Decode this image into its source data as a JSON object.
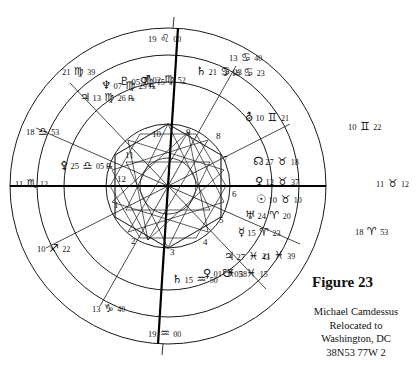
{
  "figure": {
    "title": "Figure 23",
    "subject": "Michael Camdessus",
    "line2": "Relocated to",
    "line3": "Washington, DC",
    "line4": "38N53 77W  2"
  },
  "chart": {
    "type": "astrological-natal-wheel",
    "center_x": 168,
    "center_y": 186,
    "radii": {
      "outer": 158,
      "zodiac_inner": 131,
      "planet_ring": 104,
      "house_circle": 62,
      "aspect_circle": 58
    }
  },
  "cusps": [
    {
      "id": "asc",
      "degree": "11",
      "sign": "♏",
      "minute": "12",
      "label": "Ascendant",
      "x": 16,
      "y": 176
    },
    {
      "id": "mc",
      "degree": "19",
      "sign": "♌",
      "minute": "00",
      "label": "Midheaven",
      "x": 150,
      "y": 29
    },
    {
      "id": "dsc",
      "degree": "11",
      "sign": "♉",
      "minute": "12",
      "label": "Descendant",
      "x": 377,
      "y": 176
    },
    {
      "id": "ic",
      "degree": "19",
      "sign": "♒",
      "minute": "00",
      "label": "Imum Coeli",
      "x": 150,
      "y": 327
    }
  ],
  "outer_signs": [
    {
      "degree": "19",
      "sign": "♌",
      "minute": "00",
      "x": 148,
      "y": 29
    },
    {
      "degree": "13",
      "sign": "♋",
      "minute": "40",
      "x": 229,
      "y": 48
    },
    {
      "degree": "21",
      "sign": "♍",
      "minute": "39",
      "x": 62,
      "y": 62
    },
    {
      "degree": "18",
      "sign": "♎",
      "minute": "53",
      "x": 26,
      "y": 122
    },
    {
      "degree": "11",
      "sign": "♏",
      "minute": "12",
      "x": 15,
      "y": 174
    },
    {
      "degree": "10",
      "sign": "♐",
      "minute": "22",
      "x": 37,
      "y": 239
    },
    {
      "degree": "13",
      "sign": "♑",
      "minute": "40",
      "x": 92,
      "y": 299
    },
    {
      "degree": "19",
      "sign": "♒",
      "minute": "00",
      "x": 148,
      "y": 324
    },
    {
      "degree": "21",
      "sign": "♓",
      "minute": "39",
      "x": 262,
      "y": 246
    },
    {
      "degree": "18",
      "sign": "♈",
      "minute": "53",
      "x": 355,
      "y": 222
    },
    {
      "degree": "11",
      "sign": "♉",
      "minute": "12",
      "x": 376,
      "y": 174
    },
    {
      "degree": "10",
      "sign": "♊",
      "minute": "22",
      "x": 348,
      "y": 117
    }
  ],
  "planets": [
    {
      "glyph": "♃",
      "name": "jupiter",
      "degree": "13",
      "sign": "♍",
      "minute": "26",
      "retro": "℞",
      "x": 80,
      "y": 88
    },
    {
      "glyph": "♆",
      "name": "neptune",
      "degree": "07",
      "sign": "♍",
      "minute": "29",
      "retro": "℞",
      "x": 101,
      "y": 76
    },
    {
      "glyph": "♇",
      "name": "pluto",
      "degree": "05",
      "sign": "♍",
      "minute": "15",
      "retro": "",
      "x": 119,
      "y": 72
    },
    {
      "glyph": "♂",
      "name": "mars",
      "degree": "02",
      "sign": "♍",
      "minute": "52",
      "retro": "",
      "x": 140,
      "y": 70
    },
    {
      "glyph": "♄",
      "name": "saturn",
      "degree": "21",
      "sign": "♋",
      "minute": "23",
      "retro": "",
      "x": 196,
      "y": 62
    },
    {
      "glyph": "☽",
      "name": "moon",
      "degree": "18",
      "sign": "♋",
      "minute": "23",
      "retro": "",
      "x": 219,
      "y": 63
    },
    {
      "glyph": "⛢",
      "name": "uranus",
      "degree": "10",
      "sign": "♊",
      "minute": "21",
      "retro": "",
      "x": 245,
      "y": 108
    },
    {
      "glyph": "☊",
      "name": "north-node",
      "degree": "27",
      "sign": "♉",
      "minute": "18",
      "retro": "",
      "x": 253,
      "y": 152
    },
    {
      "glyph": "♀",
      "name": "venus",
      "degree": "12",
      "sign": "♉",
      "minute": "37",
      "retro": "",
      "x": 255,
      "y": 172
    },
    {
      "glyph": "☉",
      "name": "sun",
      "degree": "10",
      "sign": "♉",
      "minute": "10",
      "retro": "",
      "x": 256,
      "y": 190
    },
    {
      "glyph": "♅",
      "name": "uranus-alt",
      "degree": "24",
      "sign": "♈",
      "minute": "20",
      "retro": "",
      "x": 245,
      "y": 206
    },
    {
      "glyph": "☿",
      "name": "mercury",
      "degree": "15",
      "sign": "♈",
      "minute": "23",
      "retro": "",
      "x": 238,
      "y": 223
    },
    {
      "glyph": "♃",
      "name": "jupiter-pisces",
      "degree": "27",
      "sign": "♓",
      "minute": "43",
      "retro": "",
      "x": 224,
      "y": 247
    },
    {
      "glyph": "♀",
      "name": "chiron",
      "degree": "01",
      "sign": "♓",
      "minute": "38",
      "retro": "",
      "x": 203,
      "y": 264
    },
    {
      "glyph": "☋",
      "name": "south-node",
      "degree": "05",
      "sign": "♓",
      "minute": "15",
      "retro": "",
      "x": 222,
      "y": 264
    },
    {
      "glyph": "♄",
      "name": "saturn-aqua",
      "degree": "15",
      "sign": "♒",
      "minute": "50",
      "retro": "",
      "x": 172,
      "y": 270
    },
    {
      "glyph": "⚴",
      "name": "pallas",
      "degree": "25",
      "sign": "♎",
      "minute": "05",
      "retro": "℞",
      "x": 60,
      "y": 156
    }
  ],
  "houses": [
    {
      "num": "1",
      "x": 114,
      "y": 201
    },
    {
      "num": "2",
      "x": 131,
      "y": 237
    },
    {
      "num": "3",
      "x": 170,
      "y": 248
    },
    {
      "num": "4",
      "x": 203,
      "y": 238
    },
    {
      "num": "5",
      "x": 219,
      "y": 216
    },
    {
      "num": "6",
      "x": 232,
      "y": 190
    },
    {
      "num": "7",
      "x": 223,
      "y": 155
    },
    {
      "num": "8",
      "x": 216,
      "y": 132
    },
    {
      "num": "9",
      "x": 186,
      "y": 128
    },
    {
      "num": "10",
      "x": 152,
      "y": 130
    },
    {
      "num": "11",
      "x": 125,
      "y": 151
    },
    {
      "num": "12",
      "x": 117,
      "y": 175
    }
  ]
}
